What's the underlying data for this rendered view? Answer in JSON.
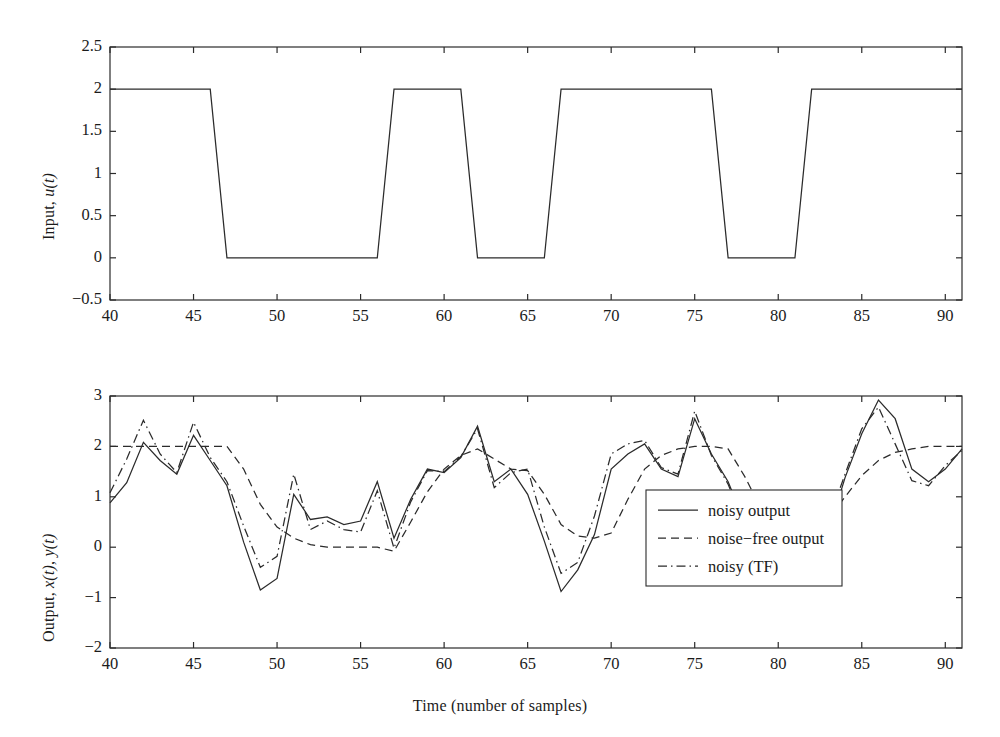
{
  "figure": {
    "width": 1000,
    "height": 737,
    "background": "#ffffff",
    "ink_color": "#2b2b2b"
  },
  "chart_data": [
    {
      "type": "line",
      "id": "input-panel",
      "title": "",
      "xlabel": "",
      "ylabel": "Input, u(t)",
      "ylabel_parts": {
        "prefix": "Input, ",
        "symbol": "u",
        "arg": "(t)"
      },
      "xlim": [
        40,
        91
      ],
      "ylim": [
        -0.5,
        2.5
      ],
      "xticks": [
        40,
        45,
        50,
        55,
        60,
        65,
        70,
        75,
        80,
        85,
        90
      ],
      "xticklabels": [
        "40",
        "45",
        "50",
        "55",
        "60",
        "65",
        "70",
        "75",
        "80",
        "85",
        "90"
      ],
      "yticks": [
        -0.5,
        0,
        0.5,
        1,
        1.5,
        2,
        2.5
      ],
      "yticklabels": [
        "-0.5",
        "0",
        "0.5",
        "1",
        "1.5",
        "2",
        "2.5"
      ],
      "grid": false,
      "legend": null,
      "series": [
        {
          "name": "input u(t)",
          "style": "solid",
          "x": [
            40,
            41,
            42,
            43,
            44,
            45,
            46,
            47,
            48,
            49,
            50,
            51,
            52,
            53,
            54,
            55,
            56,
            57,
            58,
            59,
            60,
            61,
            62,
            63,
            64,
            65,
            66,
            67,
            68,
            69,
            70,
            71,
            72,
            73,
            74,
            75,
            76,
            77,
            78,
            79,
            80,
            81,
            82,
            83,
            84,
            85,
            86,
            87,
            88,
            89,
            90,
            91
          ],
          "values": [
            2,
            2,
            2,
            2,
            2,
            2,
            2,
            0,
            0,
            0,
            0,
            0,
            0,
            0,
            0,
            0,
            0,
            2,
            2,
            2,
            2,
            2,
            0,
            0,
            0,
            0,
            0,
            2,
            2,
            2,
            2,
            2,
            2,
            2,
            2,
            2,
            2,
            0,
            0,
            0,
            0,
            0,
            2,
            2,
            2,
            2,
            2,
            2,
            2,
            2,
            2,
            2
          ]
        }
      ]
    },
    {
      "type": "line",
      "id": "output-panel",
      "title": "",
      "xlabel": "Time (number of samples)",
      "ylabel": "Output, x(t), y(t)",
      "ylabel_parts": {
        "prefix": "Output, ",
        "symbol1": "x",
        "arg1": "(t)",
        "sep": ", ",
        "symbol2": "y",
        "arg2": "(t)"
      },
      "xlim": [
        40,
        91
      ],
      "ylim": [
        -2,
        3
      ],
      "xticks": [
        40,
        45,
        50,
        55,
        60,
        65,
        70,
        75,
        80,
        85,
        90
      ],
      "xticklabels": [
        "40",
        "45",
        "50",
        "55",
        "60",
        "65",
        "70",
        "75",
        "80",
        "85",
        "90"
      ],
      "yticks": [
        -2,
        -1,
        0,
        1,
        2,
        3
      ],
      "yticklabels": [
        "-2",
        "-1",
        "0",
        "1",
        "2",
        "3"
      ],
      "grid": false,
      "legend": {
        "position": "lower-right-inside",
        "entries": [
          {
            "label": "noisy output",
            "style": "solid"
          },
          {
            "label": "noise−free output",
            "style": "dashed"
          },
          {
            "label": "noisy (TF)",
            "style": "dashdot"
          }
        ]
      },
      "x": [
        40,
        41,
        42,
        43,
        44,
        45,
        46,
        47,
        48,
        49,
        50,
        51,
        52,
        53,
        54,
        55,
        56,
        57,
        58,
        59,
        60,
        61,
        62,
        63,
        64,
        65,
        66,
        67,
        68,
        69,
        70,
        71,
        72,
        73,
        74,
        75,
        76,
        77,
        78,
        79,
        80,
        81,
        82,
        83,
        84,
        85,
        86,
        87,
        88,
        89,
        90,
        91
      ],
      "series": [
        {
          "name": "noisy output",
          "style": "solid",
          "values": [
            0.88,
            1.28,
            2.08,
            1.72,
            1.45,
            2.22,
            1.72,
            1.22,
            0.1,
            -0.85,
            -0.62,
            1.05,
            0.55,
            0.6,
            0.45,
            0.52,
            1.3,
            0.18,
            0.95,
            1.55,
            1.48,
            1.78,
            2.4,
            1.3,
            1.55,
            1.05,
            0.12,
            -0.88,
            -0.45,
            0.25,
            1.55,
            1.85,
            2.05,
            1.55,
            1.4,
            2.55,
            1.85,
            1.3,
            0.48,
            1.05,
            0.15,
            0.2,
            0.6,
            0.3,
            1.38,
            2.25,
            2.92,
            2.55,
            1.55,
            1.3,
            1.55,
            1.95
          ]
        },
        {
          "name": "noise−free output",
          "style": "dashed",
          "values": [
            2.0,
            2.0,
            2.0,
            2.0,
            2.0,
            2.0,
            2.0,
            2.0,
            1.55,
            0.85,
            0.4,
            0.18,
            0.05,
            0.0,
            0.0,
            0.0,
            0.0,
            -0.08,
            0.5,
            1.1,
            1.55,
            1.82,
            1.95,
            1.75,
            1.55,
            1.52,
            1.05,
            0.45,
            0.22,
            0.18,
            0.28,
            0.95,
            1.55,
            1.82,
            1.95,
            2.0,
            2.0,
            1.95,
            1.4,
            0.75,
            0.35,
            0.1,
            0.05,
            0.55,
            1.0,
            1.42,
            1.72,
            1.88,
            1.95,
            2.0,
            2.0,
            2.0
          ]
        },
        {
          "name": "noisy (TF)",
          "style": "dashdot",
          "values": [
            1.08,
            1.75,
            2.52,
            1.85,
            1.48,
            2.48,
            1.78,
            1.3,
            0.42,
            -0.4,
            -0.18,
            1.45,
            0.35,
            0.52,
            0.35,
            0.3,
            1.12,
            -0.02,
            0.9,
            1.52,
            1.5,
            1.8,
            2.35,
            1.18,
            1.48,
            1.55,
            0.4,
            -0.52,
            -0.3,
            0.62,
            1.85,
            2.05,
            2.12,
            1.58,
            1.45,
            2.7,
            1.82,
            1.25,
            0.42,
            0.95,
            0.05,
            0.18,
            0.82,
            0.52,
            1.45,
            2.35,
            2.78,
            2.05,
            1.32,
            1.22,
            1.62,
            1.92
          ]
        }
      ]
    }
  ]
}
